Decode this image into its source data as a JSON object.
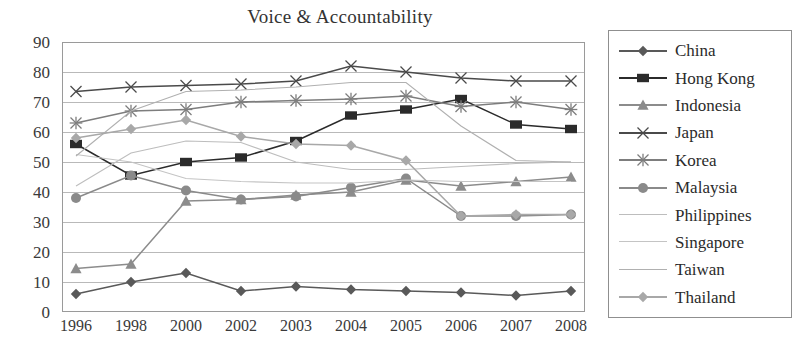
{
  "chart": {
    "title": "Voice & Accountability",
    "type": "line",
    "xlabel": "",
    "ylabel": "",
    "grid": true,
    "legend_position": "right"
  },
  "chart_data": {
    "type": "line",
    "title": "Voice & Accountability",
    "xlabel": "",
    "ylabel": "",
    "ylim": [
      0,
      90
    ],
    "yticks": [
      0,
      10,
      20,
      30,
      40,
      50,
      60,
      70,
      80,
      90
    ],
    "grid": true,
    "legend_position": "right",
    "categories": [
      "1996",
      "1998",
      "2000",
      "2002",
      "2003",
      "2004",
      "2005",
      "2006",
      "2007",
      "2008"
    ],
    "series": [
      {
        "name": "China",
        "marker": "diamond",
        "color": "#595959",
        "values": [
          6,
          10,
          13,
          7,
          8.5,
          7.5,
          7,
          6.5,
          5.5,
          7
        ]
      },
      {
        "name": "Hong Kong",
        "marker": "square",
        "color": "#2b2b2b",
        "values": [
          56,
          45.5,
          50,
          51.5,
          57,
          65.5,
          67.5,
          71,
          62.5,
          61
        ]
      },
      {
        "name": "Indonesia",
        "marker": "triangle",
        "color": "#8c8c8c",
        "values": [
          14.5,
          16,
          37,
          37.5,
          39,
          40,
          44,
          42,
          43.5,
          45
        ]
      },
      {
        "name": "Japan",
        "marker": "x",
        "color": "#4a4a4a",
        "values": [
          73.5,
          75,
          75.5,
          76,
          77,
          82,
          80,
          78,
          77,
          77
        ]
      },
      {
        "name": "Korea",
        "marker": "asterisk",
        "color": "#7d7d7d",
        "values": [
          63,
          67,
          67.5,
          70,
          70.5,
          71,
          72,
          68.5,
          70,
          67.5
        ]
      },
      {
        "name": "Malaysia",
        "marker": "circle",
        "color": "#8a8a8a",
        "values": [
          38,
          45.5,
          40.5,
          37.5,
          38.5,
          41.5,
          44.5,
          32,
          32,
          32.5
        ]
      },
      {
        "name": "Philippines",
        "marker": "none",
        "color": "#bdbdbd",
        "values": [
          42,
          53,
          57,
          56.5,
          50,
          47.5,
          47.5,
          48.5,
          49.5,
          50
        ]
      },
      {
        "name": "Singapore",
        "marker": "none",
        "color": "#c4c4c4",
        "values": [
          52.5,
          50,
          44.5,
          43.5,
          43,
          43,
          44,
          43.5,
          43.5,
          43.5
        ]
      },
      {
        "name": "Taiwan",
        "marker": "none",
        "color": "#b0b0b0",
        "values": [
          52,
          67,
          73.5,
          74,
          75,
          76.5,
          76.5,
          62,
          50.5,
          50
        ]
      },
      {
        "name": "Thailand",
        "marker": "diamond",
        "color": "#a8a8a8",
        "values": [
          58,
          61,
          64,
          58.5,
          56,
          55.5,
          50.5,
          32,
          32.5,
          32.5
        ]
      }
    ]
  }
}
